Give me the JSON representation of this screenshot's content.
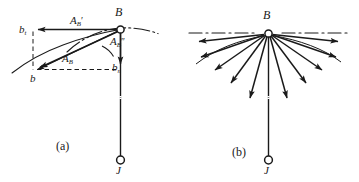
{
  "figure": {
    "background_color": "#ffffff",
    "ink_color": "#1a1a1a",
    "width": 359,
    "height": 182
  },
  "panel_a": {
    "caption": "(a)",
    "points": {
      "b_point_label": "B",
      "joint_label": "J"
    },
    "vectors": {
      "tangential_top": {
        "symbol": "A",
        "sub": "B",
        "prime": "′"
      },
      "normal_right": {
        "symbol": "A",
        "sub": "B",
        "prime": "″"
      },
      "resultant": {
        "symbol": "A",
        "sub": "B",
        "prime": ""
      }
    },
    "components": {
      "tangential_end": {
        "symbol": "b",
        "sub": "t"
      },
      "normal_end": {
        "symbol": "b",
        "sub": "n"
      },
      "resultant_end": {
        "symbol": "b",
        "sub": ""
      }
    }
  },
  "panel_b": {
    "caption": "(b)",
    "points": {
      "b_point_label": "B",
      "joint_label": "J"
    },
    "fan": {
      "arrow_count": 11,
      "description": "radial acceleration vector fan from point B"
    }
  }
}
